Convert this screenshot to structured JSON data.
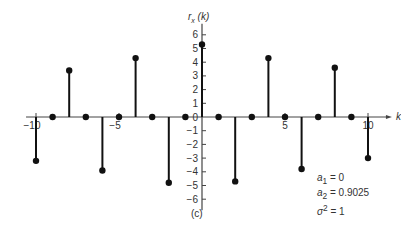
{
  "chart_data": {
    "type": "stem",
    "title": "",
    "xlabel": "k",
    "ylabel": "r_x (k)",
    "x": [
      -10,
      -9,
      -8,
      -7,
      -6,
      -5,
      -4,
      -3,
      -2,
      -1,
      0,
      1,
      2,
      3,
      4,
      5,
      6,
      7,
      8,
      9,
      10
    ],
    "values": [
      -3.2,
      0,
      3.4,
      0,
      -3.9,
      0,
      4.3,
      0,
      -4.8,
      0,
      5.3,
      0,
      -4.7,
      0,
      4.3,
      0,
      -3.8,
      0,
      3.6,
      0,
      -3.0
    ],
    "xlim": [
      -10.5,
      11
    ],
    "ylim": [
      -6.5,
      6.5
    ],
    "xticks": [
      "-10",
      "-5",
      "5",
      "10"
    ],
    "yticks": [
      "6",
      "5",
      "4",
      "3",
      "2",
      "1",
      "0",
      "-1",
      "-2",
      "-3",
      "-4",
      "-5",
      "-6"
    ],
    "annotations": [
      "a1 = 0",
      "a2 = 0.9025",
      "σ² = 1"
    ],
    "caption": "(c)",
    "grid": false
  },
  "labels": {
    "ylabel_main": "r",
    "ylabel_sub": "x",
    "ylabel_arg": "(k)",
    "xlabel": "k",
    "param_a1": "a",
    "param_a1_sub": "1",
    "param_a1_val": " = 0",
    "param_a2": "a",
    "param_a2_sub": "2",
    "param_a2_val": " = 0.9025",
    "param_s": "σ",
    "param_s_sup": "2",
    "param_s_val": " = 1",
    "caption": "(c)"
  }
}
